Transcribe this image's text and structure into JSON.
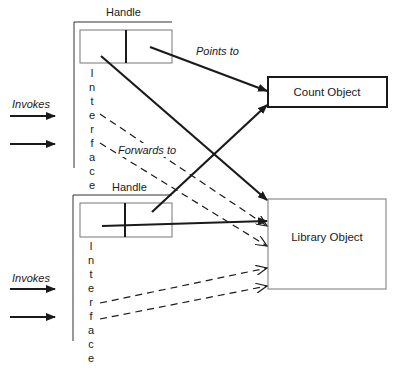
{
  "diagram": {
    "title": "",
    "colors": {
      "ink": "#1a1a1a",
      "box_border": "#777777",
      "background": "#ffffff"
    },
    "handles": [
      {
        "label": "Handle",
        "interface_letters": [
          "I",
          "n",
          "t",
          "e",
          "r",
          "f",
          "a",
          "c",
          "e"
        ],
        "invokes_label": "Invokes"
      },
      {
        "label": "Handle",
        "interface_letters": [
          "I",
          "n",
          "t",
          "e",
          "r",
          "f",
          "a",
          "c",
          "e"
        ],
        "invokes_label": "Invokes"
      }
    ],
    "objects": {
      "count": {
        "label": "Count Object"
      },
      "library": {
        "label": "Library Object"
      }
    },
    "edge_labels": {
      "points_to": "Points to",
      "forwards_to": "Forwards to"
    },
    "edges": [
      {
        "from": "handle-1.right",
        "to": "count-object",
        "style": "solid",
        "label": "Points to"
      },
      {
        "from": "handle-1.left",
        "to": "library-object",
        "style": "solid"
      },
      {
        "from": "handle-1.interface.e",
        "to": "library-object",
        "style": "dashed",
        "label": "Forwards to"
      },
      {
        "from": "handle-1.interface.f",
        "to": "library-object",
        "style": "dashed"
      },
      {
        "from": "handle-2.right",
        "to": "count-object",
        "style": "solid"
      },
      {
        "from": "handle-2.left",
        "to": "library-object",
        "style": "solid"
      },
      {
        "from": "handle-2.interface.r",
        "to": "library-object",
        "style": "dashed"
      },
      {
        "from": "handle-2.interface.f",
        "to": "library-object",
        "style": "dashed"
      }
    ]
  }
}
